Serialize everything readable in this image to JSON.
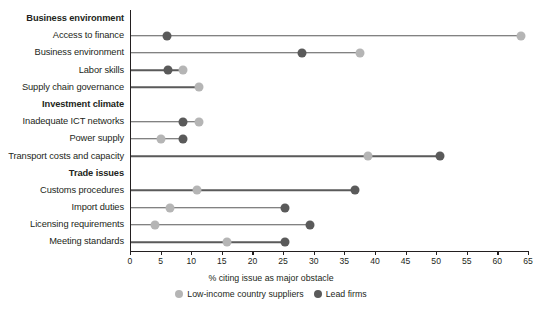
{
  "chart_data": {
    "type": "scatter",
    "title": "",
    "xlabel": "% citing issue as major obstacle",
    "ylabel": "",
    "xlim": [
      0,
      65
    ],
    "xticks": [
      0,
      5,
      10,
      15,
      20,
      25,
      30,
      35,
      40,
      45,
      50,
      55,
      60,
      65
    ],
    "grid": false,
    "legend_position": "bottom",
    "series": [
      {
        "name": "Low-income country suppliers",
        "color": "#b5b5b5"
      },
      {
        "name": "Lead firms",
        "color": "#5a5a5a"
      }
    ],
    "rows": [
      {
        "label": "Business environment",
        "group": true
      },
      {
        "label": "Access to finance",
        "group": false,
        "low": 63.9,
        "lead": 6.0
      },
      {
        "label": "Business environment",
        "group": false,
        "low": 37.6,
        "lead": 28.1
      },
      {
        "label": "Labor skills",
        "group": false,
        "low": 8.7,
        "lead": 6.2
      },
      {
        "label": "Supply chain governance",
        "group": false,
        "low": 11.3,
        "lead": null
      },
      {
        "label": "Investment climate",
        "group": true
      },
      {
        "label": "Inadequate ICT networks",
        "group": false,
        "low": 11.3,
        "lead": 8.7
      },
      {
        "label": "Power supply",
        "group": false,
        "low": 5.0,
        "lead": 8.7
      },
      {
        "label": "Transport costs and capacity",
        "group": false,
        "low": 38.9,
        "lead": 50.6
      },
      {
        "label": "Trade issues",
        "group": true
      },
      {
        "label": "Customs procedures",
        "group": false,
        "low": 11.0,
        "lead": 36.8
      },
      {
        "label": "Import duties",
        "group": false,
        "low": 6.5,
        "lead": 25.3
      },
      {
        "label": "Licensing requirements",
        "group": false,
        "low": 4.1,
        "lead": 29.4
      },
      {
        "label": "Meeting standards",
        "group": false,
        "low": 15.8,
        "lead": 25.3
      }
    ]
  },
  "colors": {
    "lead_firms": "#5a5a5a",
    "low_income": "#b5b5b5",
    "axis": "#231f20",
    "background": "#ffffff"
  },
  "source": {
    "text": ""
  }
}
